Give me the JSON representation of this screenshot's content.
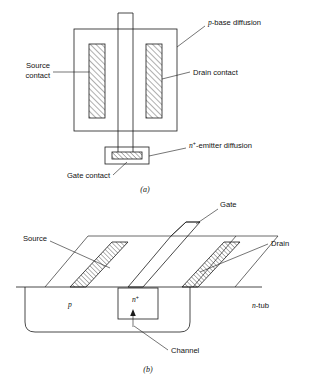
{
  "figure": {
    "captions": {
      "a": "(a)",
      "b": "(b)"
    },
    "panel_a": {
      "name": "plan-view",
      "labels": {
        "p_base": "p-base diffusion",
        "p_base_italic": "p",
        "p_base_rest": "-base diffusion",
        "source_contact_line1": "Source",
        "source_contact_line2": "contact",
        "drain_contact": "Drain contact",
        "gate_contact": "Gate contact",
        "n_emitter_italic": "n",
        "n_emitter_sup": "+",
        "n_emitter_rest": "-emitter diffusion",
        "n_emitter_full": "n+-emitter diffusion"
      }
    },
    "panel_b": {
      "name": "perspective-cross-section",
      "labels": {
        "gate": "Gate",
        "source": "Source",
        "drain": "Drain",
        "channel": "Channel",
        "p_region": "p",
        "n_plus_region_italic": "n",
        "n_plus_region_sup": "+",
        "n_plus_region_full": "n+",
        "n_tub_italic": "n",
        "n_tub_rest": "-tub",
        "n_tub_full": "n-tub"
      }
    },
    "colors": {
      "line": "#1a1a1a",
      "background": "#ffffff",
      "hatch": "#1a1a1a"
    }
  }
}
